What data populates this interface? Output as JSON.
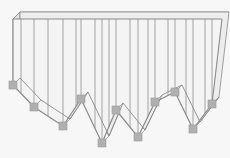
{
  "figure": {
    "canvas": {
      "width": 230,
      "height": 158
    },
    "background_color": "#f7f7f7",
    "face_fill": "#f4f4f4",
    "top_fill": "#ededed",
    "side_fill": "#e4e4e4",
    "outline_color": "#8a8a8a",
    "rib_color": "#9a9a9a",
    "marker_color": "#b0b0b0",
    "marker_border_color": "#9a9a9a",
    "marker_size": 8,
    "depth": {
      "dx": 7,
      "dy": -7
    },
    "top_edge_y": 19,
    "left_edge_x": 13,
    "right_edge_x": 222,
    "zigzag_vertices": [
      {
        "label": "v0",
        "x": 13,
        "y": 85,
        "kind": "start",
        "marker": true
      },
      {
        "label": "v1",
        "x": 34,
        "y": 107,
        "kind": "slope",
        "marker": true
      },
      {
        "label": "v2",
        "x": 63,
        "y": 126,
        "kind": "valley",
        "marker": true
      },
      {
        "label": "v3",
        "x": 81,
        "y": 99,
        "kind": "peak",
        "marker": true
      },
      {
        "label": "v4",
        "x": 102,
        "y": 143,
        "kind": "valley",
        "marker": true
      },
      {
        "label": "v5",
        "x": 116,
        "y": 110,
        "kind": "peak",
        "marker": true
      },
      {
        "label": "v6",
        "x": 138,
        "y": 137,
        "kind": "valley",
        "marker": true
      },
      {
        "label": "v7",
        "x": 155,
        "y": 102,
        "kind": "peak",
        "marker": true
      },
      {
        "label": "v8",
        "x": 175,
        "y": 92,
        "kind": "peak",
        "marker": true
      },
      {
        "label": "v9",
        "x": 193,
        "y": 129,
        "kind": "valley",
        "marker": true
      },
      {
        "label": "v10",
        "x": 212,
        "y": 104,
        "kind": "end",
        "marker": true
      }
    ],
    "rib_lines_x": [
      21,
      34,
      48,
      63,
      76,
      81,
      95,
      102,
      109,
      116,
      130,
      138,
      148,
      155,
      168,
      175,
      186,
      193,
      205,
      212
    ],
    "rib_top_y": 19,
    "labels": {
      "shape_name": "Zigzag curtain",
      "units": ""
    }
  }
}
